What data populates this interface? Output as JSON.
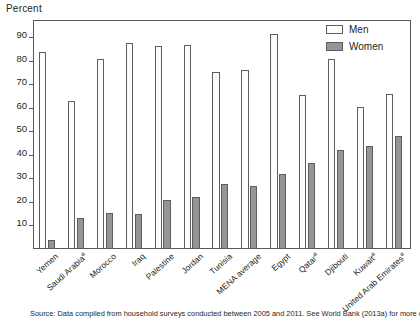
{
  "chart_data": {
    "type": "bar",
    "title": "",
    "ylabel": "Percent",
    "xlabel": "",
    "ylim": [
      0,
      97
    ],
    "yticks": [
      10,
      20,
      30,
      40,
      50,
      60,
      70,
      80,
      90
    ],
    "grid": false,
    "legend_position": "top-right",
    "categories": [
      "Yemen",
      "Saudi Arabia",
      "Morocco",
      "Iraq",
      "Palestine",
      "Jordan",
      "Tunisia",
      "MENA average",
      "Egypt",
      "Qatar",
      "Djibouti",
      "Kuwait",
      "United Arab Emirates"
    ],
    "category_footnotes": [
      "",
      "a",
      "",
      "",
      "",
      "",
      "",
      "",
      "",
      "a",
      "",
      "a",
      "a"
    ],
    "series": [
      {
        "name": "Men",
        "color": "#fdfdfd",
        "values": [
          84,
          63,
          81,
          87.5,
          86.5,
          87,
          75.5,
          76,
          91.5,
          65.5,
          81,
          60.5,
          66
        ]
      },
      {
        "name": "Women",
        "color": "#939598",
        "values": [
          4,
          13,
          15.5,
          15,
          21,
          22,
          27.5,
          27,
          32,
          36.5,
          42,
          44,
          48
        ]
      }
    ]
  },
  "axis": {
    "y_title": "Percent"
  },
  "legend": {
    "items": [
      {
        "label": "Men",
        "swatch": "men"
      },
      {
        "label": "Women",
        "swatch": "women"
      }
    ]
  },
  "footer": {
    "source": "Source: Data compiled from household surveys conducted between 2005 and 2011. See World Bank (2013a) for more detail."
  }
}
